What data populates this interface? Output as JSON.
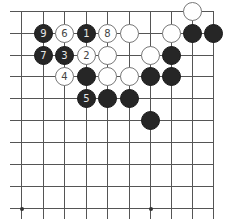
{
  "diagram": {
    "type": "go-board-fragment",
    "grid": {
      "columns_x": [
        21,
        43,
        64,
        86,
        107,
        129,
        150,
        171,
        192,
        213
      ],
      "rows_y": [
        11,
        33,
        55,
        76,
        98,
        120,
        142,
        164,
        186,
        208
      ],
      "edges": {
        "top": true,
        "right": true,
        "left": false,
        "bottom": false
      }
    },
    "star_points": [
      {
        "col": 0,
        "row": 9
      },
      {
        "col": 6,
        "row": 9
      }
    ],
    "stones": [
      {
        "col": 8,
        "row": 0,
        "color": "white",
        "label": ""
      },
      {
        "col": 1,
        "row": 1,
        "color": "black",
        "label": "9"
      },
      {
        "col": 2,
        "row": 1,
        "color": "white",
        "label": "6"
      },
      {
        "col": 3,
        "row": 1,
        "color": "black",
        "label": "1"
      },
      {
        "col": 4,
        "row": 1,
        "color": "white",
        "label": "8"
      },
      {
        "col": 5,
        "row": 1,
        "color": "white",
        "label": ""
      },
      {
        "col": 7,
        "row": 1,
        "color": "white",
        "label": ""
      },
      {
        "col": 8,
        "row": 1,
        "color": "black",
        "label": ""
      },
      {
        "col": 9,
        "row": 1,
        "color": "black",
        "label": ""
      },
      {
        "col": 1,
        "row": 2,
        "color": "black",
        "label": "7"
      },
      {
        "col": 2,
        "row": 2,
        "color": "black",
        "label": "3"
      },
      {
        "col": 3,
        "row": 2,
        "color": "white",
        "label": "2"
      },
      {
        "col": 4,
        "row": 2,
        "color": "white",
        "label": ""
      },
      {
        "col": 6,
        "row": 2,
        "color": "white",
        "label": ""
      },
      {
        "col": 7,
        "row": 2,
        "color": "black",
        "label": ""
      },
      {
        "col": 2,
        "row": 3,
        "color": "white",
        "label": "4"
      },
      {
        "col": 3,
        "row": 3,
        "color": "black",
        "label": ""
      },
      {
        "col": 4,
        "row": 3,
        "color": "white",
        "label": ""
      },
      {
        "col": 5,
        "row": 3,
        "color": "white",
        "label": ""
      },
      {
        "col": 6,
        "row": 3,
        "color": "black",
        "label": ""
      },
      {
        "col": 7,
        "row": 3,
        "color": "black",
        "label": ""
      },
      {
        "col": 3,
        "row": 4,
        "color": "black",
        "label": "5"
      },
      {
        "col": 4,
        "row": 4,
        "color": "black",
        "label": ""
      },
      {
        "col": 5,
        "row": 4,
        "color": "black",
        "label": ""
      },
      {
        "col": 6,
        "row": 5,
        "color": "black",
        "label": ""
      }
    ]
  }
}
